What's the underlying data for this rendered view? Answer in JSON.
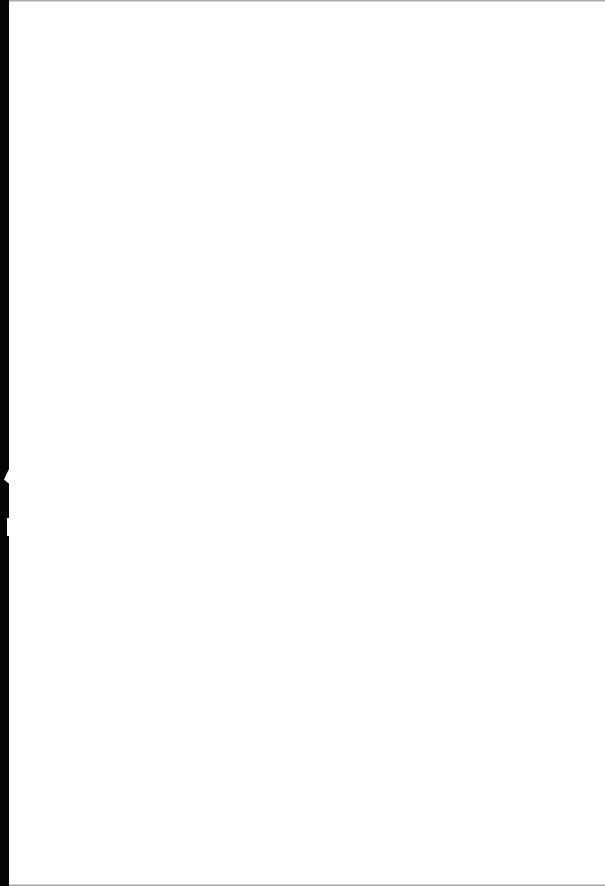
{
  "document": {
    "type": "blank scanned page",
    "content": "",
    "colors": {
      "page": "#ffffff",
      "scanner_edge": "#050505"
    }
  }
}
